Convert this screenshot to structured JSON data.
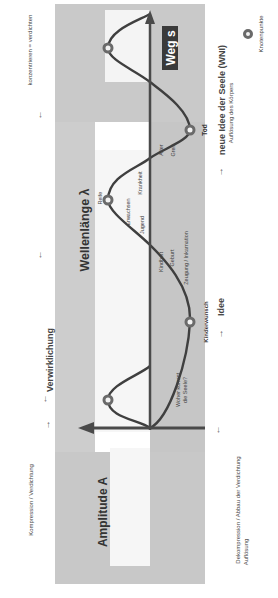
{
  "diagram": {
    "orientation": "rotated 90° counter-clockwise",
    "colors": {
      "band": "#c8c8c8",
      "band_light": "#e6e6e6",
      "axis": "#4a4a4a",
      "curve": "#3c3c3c",
      "node": "#5a5a5a",
      "label_box": "#3a3a3a",
      "text": "#333333"
    },
    "axes": {
      "amplitude_label": "Amplitude A",
      "path_label": "Weg s",
      "wavelength_label": "Wellenlänge λ"
    },
    "top_annotations": {
      "left": "Kompression / Verdichtung",
      "center": "Verwirklichung",
      "right": "konzentrieren = verdichten"
    },
    "bottom_annotations": {
      "left_line1": "Dekompression / Abbau der Verdichtung",
      "left_line2": "Auflösung",
      "idea": "Idee",
      "new_idea_line1": "neue Idee der Seele (WNI)",
      "new_idea_line2": "Auflösung des Körpers",
      "legend": "Knotenpunkte"
    },
    "wave_labels": {
      "origin_question_line1": "Woher kommt",
      "origin_question_line2": "die Seele?",
      "kinderwunsch": "Kinderwunsch",
      "zeugung": "Zeugung / Inkarnation",
      "geburt": "Geburt",
      "kindheit": "Kindheit",
      "jugend": "Jugend",
      "erwachsen": "Erwachsen",
      "reife": "Reife",
      "krankheit": "Krankheit",
      "alter": "Alter",
      "greis": "Greis",
      "tod": "Tod"
    }
  }
}
